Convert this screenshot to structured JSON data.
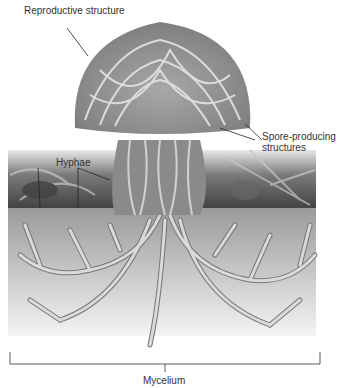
{
  "diagram": {
    "labels": {
      "reproductive_structure": "Reproductive structure",
      "hyphae": "Hyphae",
      "spore_producing_line1": "Spore-producing",
      "spore_producing_line2": "structures",
      "mycelium": "Mycelium"
    },
    "colors": {
      "cap": "#8f8f8f",
      "hyphae_strand": "#d4d4d4",
      "soil_top": "#9a9a9a",
      "soil_bottom": "#f2f2f2",
      "ground_litter": "#5a5a5a",
      "text": "#333333"
    }
  }
}
